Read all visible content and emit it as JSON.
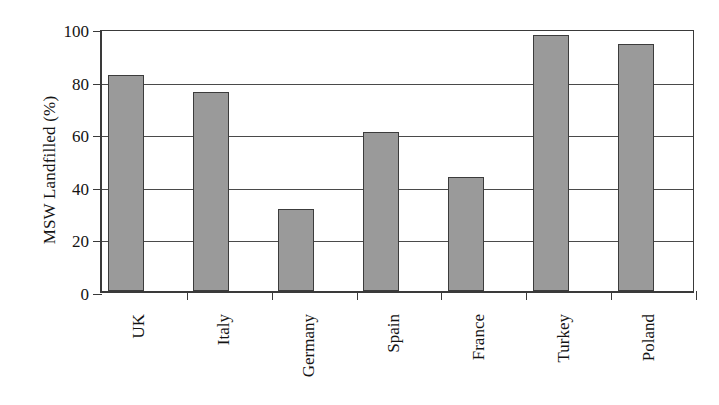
{
  "chart_data": {
    "type": "bar",
    "title": "",
    "subtitle": "",
    "xlabel": "",
    "ylabel": "MSW Landfilled (%)",
    "categories": [
      "UK",
      "Italy",
      "Germany",
      "Spain",
      "France",
      "Turkey",
      "Poland"
    ],
    "values": [
      82,
      75.5,
      31,
      60.5,
      43.5,
      97.5,
      94
    ],
    "series": [
      {
        "name": "MSW Landfilled",
        "values": [
          82,
          75.5,
          31,
          60.5,
          43.5,
          97.5,
          94
        ]
      }
    ],
    "ylim": [
      0,
      100
    ],
    "ytick_labels": [
      "0",
      "20",
      "40",
      "60",
      "80",
      "100"
    ],
    "ytick_values": [
      0,
      20,
      40,
      60,
      80,
      100
    ],
    "grid": "horizontal",
    "legend": "none",
    "bar_color": "#9a9a9a",
    "bar_edge_color": "#3c3c3c",
    "axis_color": "#3a3a3a",
    "background_color": "#ffffff",
    "xtick_label_rotation": 90,
    "annotations": []
  },
  "axis": {
    "y_title": "MSW Landfilled (%)"
  }
}
